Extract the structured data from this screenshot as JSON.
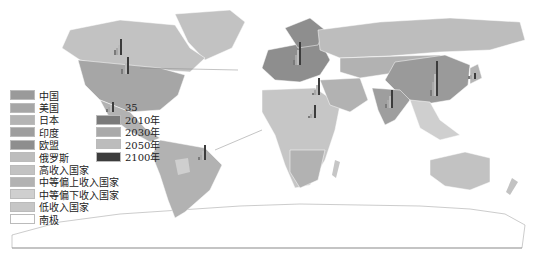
{
  "map": {
    "type": "world thematic map",
    "background": "#ffffff",
    "ocean": "#ffffff"
  },
  "legend_categories": [
    {
      "label": "中国",
      "color": "#9a9a9a"
    },
    {
      "label": "美国",
      "color": "#a6a6a6"
    },
    {
      "label": "日本",
      "color": "#b4b4b4"
    },
    {
      "label": "印度",
      "color": "#9e9e9e"
    },
    {
      "label": "欧盟",
      "color": "#8e8e8e"
    },
    {
      "label": "俄罗斯",
      "color": "#bdbdbd"
    },
    {
      "label": "高收入国家",
      "color": "#c2c2c2"
    },
    {
      "label": "中等偏上收入国家",
      "color": "#b2b2b2"
    },
    {
      "label": "中等偏下收入国家",
      "color": "#cfcfcf"
    },
    {
      "label": "低收入国家",
      "color": "#c6c6c6"
    },
    {
      "label": "南极",
      "color": "#ffffff"
    }
  ],
  "legend_bars": {
    "scale_label": "35",
    "years": [
      {
        "label": "2010年",
        "color": "#7a7a7a"
      },
      {
        "label": "2030年",
        "color": "#a9a9a9"
      },
      {
        "label": "2050年",
        "color": "#bcbcbc"
      },
      {
        "label": "2100年",
        "color": "#3c3c3c"
      }
    ]
  },
  "bar_locations": [
    "北美(加拿大)",
    "美国",
    "巴西",
    "欧盟",
    "非洲北部",
    "非洲中部",
    "印度",
    "中国",
    "日本"
  ]
}
